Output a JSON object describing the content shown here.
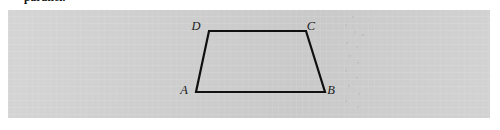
{
  "page": {
    "width": 500,
    "height": 130,
    "background_color": "#ffffff"
  },
  "caption": {
    "text": "parallel.",
    "clipped": "true"
  },
  "panel": {
    "background_color": "#d4d4d4",
    "x": 8,
    "y": 10,
    "width": 482,
    "height": 108
  },
  "figure": {
    "type": "trapezoid",
    "stroke_color": "#101010",
    "stroke_width": 2.2,
    "vertices": [
      {
        "label": "A",
        "x": 196,
        "y": 92,
        "label_x": 184,
        "label_y": 94
      },
      {
        "label": "B",
        "x": 325,
        "y": 92,
        "label_x": 331,
        "label_y": 94
      },
      {
        "label": "C",
        "x": 306,
        "y": 31,
        "label_x": 311,
        "label_y": 30
      },
      {
        "label": "D",
        "x": 209,
        "y": 31,
        "label_x": 196,
        "label_y": 30
      }
    ],
    "edges": [
      {
        "name": "AB",
        "from": "A",
        "to": "B"
      },
      {
        "name": "BC",
        "from": "B",
        "to": "C"
      },
      {
        "name": "CD",
        "from": "C",
        "to": "D"
      },
      {
        "name": "DA",
        "from": "D",
        "to": "A"
      }
    ]
  },
  "speckles": [
    {
      "x": 352,
      "y": 16,
      "size": 2
    },
    {
      "x": 345,
      "y": 24,
      "size": 2
    },
    {
      "x": 354,
      "y": 31,
      "size": 2
    },
    {
      "x": 362,
      "y": 34,
      "size": 2
    },
    {
      "x": 346,
      "y": 42,
      "size": 2
    },
    {
      "x": 356,
      "y": 46,
      "size": 2
    },
    {
      "x": 349,
      "y": 55,
      "size": 2
    },
    {
      "x": 357,
      "y": 62,
      "size": 2
    },
    {
      "x": 345,
      "y": 70,
      "size": 2
    },
    {
      "x": 356,
      "y": 77,
      "size": 2
    },
    {
      "x": 348,
      "y": 85,
      "size": 2
    },
    {
      "x": 358,
      "y": 93,
      "size": 2
    },
    {
      "x": 345,
      "y": 100,
      "size": 2
    },
    {
      "x": 357,
      "y": 106,
      "size": 2
    },
    {
      "x": 368,
      "y": 20,
      "size": 1
    },
    {
      "x": 371,
      "y": 52,
      "size": 1
    },
    {
      "x": 366,
      "y": 88,
      "size": 1
    }
  ]
}
